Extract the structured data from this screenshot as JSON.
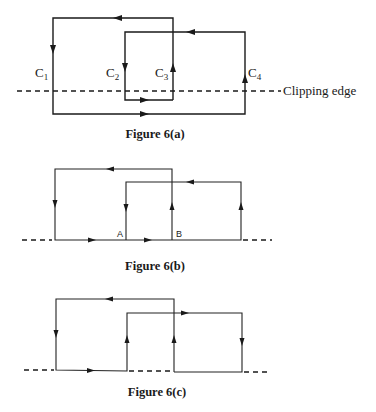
{
  "figure_a": {
    "caption": "Figure 6(a)",
    "edge_labels": {
      "c1": {
        "main": "C",
        "sub": "1"
      },
      "c2": {
        "main": "C",
        "sub": "2"
      },
      "c3": {
        "main": "C",
        "sub": "3"
      },
      "c4": {
        "main": "C",
        "sub": "4"
      }
    },
    "clipping_edge_label": "Clipping edge"
  },
  "figure_b": {
    "caption": "Figure 6(b)",
    "point_a": "A",
    "point_b": "B"
  },
  "figure_c": {
    "caption": "Figure 6(c)"
  }
}
